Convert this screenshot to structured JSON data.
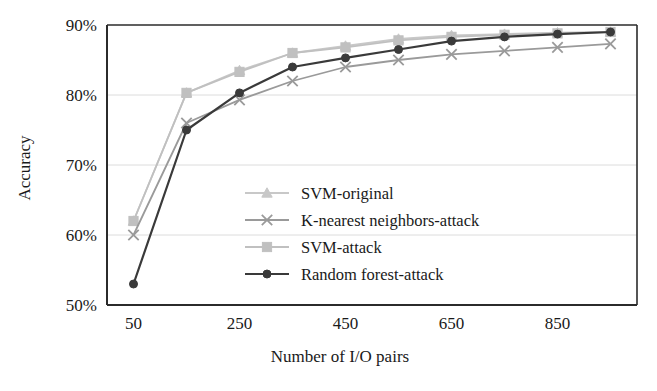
{
  "chart_data": {
    "type": "line",
    "title": "",
    "xlabel": "Number of I/O pairs",
    "ylabel": "Accuracy",
    "x": [
      50,
      150,
      250,
      350,
      450,
      550,
      650,
      750,
      850,
      950
    ],
    "xlim": [
      0,
      1000
    ],
    "ylim": [
      50,
      90
    ],
    "xticks": [
      50,
      250,
      450,
      650,
      850
    ],
    "xtick_labels": [
      "50",
      "250",
      "450",
      "650",
      "850"
    ],
    "yticks": [
      50,
      60,
      70,
      80,
      90
    ],
    "ytick_labels": [
      "50%",
      "60%",
      "70%",
      "80%",
      "90%"
    ],
    "grid": true,
    "grid_axis": "y",
    "legend_position": "center",
    "series": [
      {
        "name": "SVM-original",
        "marker": "triangle",
        "color": "#c8c8c8",
        "values": [
          62.0,
          80.3,
          83.5,
          86.0,
          87.0,
          88.0,
          88.5,
          88.7,
          88.9,
          89.0
        ]
      },
      {
        "name": "K-nearest neighbors-attack",
        "marker": "x",
        "color": "#9a9a9a",
        "values": [
          60.0,
          76.0,
          79.3,
          82.0,
          84.0,
          85.0,
          85.8,
          86.3,
          86.8,
          87.3
        ]
      },
      {
        "name": "SVM-attack",
        "marker": "square",
        "color": "#c0c0c0",
        "values": [
          62.0,
          80.3,
          83.3,
          86.0,
          86.8,
          87.8,
          88.3,
          88.6,
          88.8,
          89.0
        ]
      },
      {
        "name": "Random forest-attack",
        "marker": "circle",
        "color": "#3a3a3a",
        "values": [
          53.0,
          75.0,
          80.3,
          84.0,
          85.3,
          86.5,
          87.7,
          88.3,
          88.7,
          89.0
        ]
      }
    ]
  },
  "legend": {
    "items": [
      {
        "label": "SVM-original"
      },
      {
        "label": "K-nearest neighbors-attack"
      },
      {
        "label": "SVM-attack"
      },
      {
        "label": "Random forest-attack"
      }
    ]
  },
  "axes": {
    "x_title": "Number of I/O pairs",
    "y_title": "Accuracy"
  },
  "colors": {
    "axis": "#2b2b2b",
    "grid": "#dcdcdc",
    "background": "#ffffff"
  }
}
